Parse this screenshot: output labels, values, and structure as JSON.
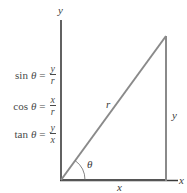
{
  "diagram": {
    "type": "right-triangle-trigonometry",
    "axes": {
      "x_label": "x",
      "y_label": "y"
    },
    "triangle": {
      "hypotenuse_label": "r",
      "opposite_label": "y",
      "adjacent_label": "x",
      "angle_label": "θ"
    },
    "formulas": [
      {
        "fn": "sin",
        "theta": "θ",
        "eq": "=",
        "numerator": "y",
        "denominator": "r"
      },
      {
        "fn": "cos",
        "theta": "θ",
        "eq": "=",
        "numerator": "x",
        "denominator": "r"
      },
      {
        "fn": "tan",
        "theta": "θ",
        "eq": "=",
        "numerator": "y",
        "denominator": "x"
      }
    ],
    "colors": {
      "axis": "#3a3a3a",
      "triangle": "#8a8a8a",
      "text": "#3a3a3a"
    }
  }
}
